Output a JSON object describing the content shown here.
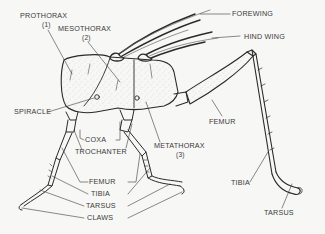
{
  "diagram": {
    "colors": {
      "background": "#f7f7f5",
      "ink": "#2a2a2a",
      "label": "#3a3a3a"
    },
    "labels": {
      "prothorax": "PROTHORAX",
      "prothorax_num": "(1)",
      "mesothorax": "MESOTHORAX",
      "mesothorax_num": "(2)",
      "metathorax": "METATHORAX",
      "metathorax_num": "(3)",
      "forewing": "FOREWING",
      "hind_wing": "HIND WING",
      "spiracle": "SPIRACLE",
      "coxa": "COXA",
      "trochanter": "TROCHANTER",
      "femur_leg": "FEMUR",
      "tibia_leg": "TIBIA",
      "tarsus_leg": "TARSUS",
      "claws": "CLAWS",
      "femur_hind": "FEMUR",
      "tibia_hind": "TIBIA",
      "tarsus_hind": "TARSUS"
    }
  }
}
